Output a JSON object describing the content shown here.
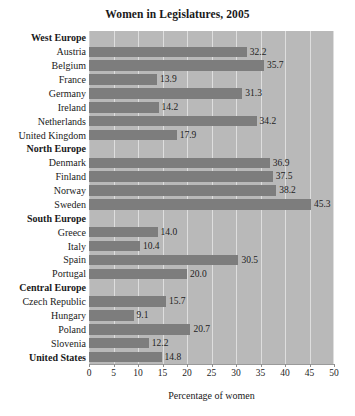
{
  "chart_data": {
    "type": "bar",
    "orientation": "horizontal",
    "title": "Women in Legislatures, 2005",
    "xlabel": "Percentage of women",
    "ylabel": "",
    "xlim": [
      0,
      50
    ],
    "xticks": [
      0,
      5,
      10,
      15,
      20,
      25,
      30,
      35,
      40,
      45,
      50
    ],
    "xtick_labels": [
      "0",
      "5",
      "10",
      "15",
      "20",
      "25",
      "30",
      "35",
      "40",
      "45",
      "50"
    ],
    "grid": true,
    "grid_axis": "x",
    "legend": false,
    "value_label_format": "one-decimal",
    "categories": [
      "West Europe",
      "Austria",
      "Belgium",
      "France",
      "Germany",
      "Ireland",
      "Netherlands",
      "United Kingdom",
      "North Europe",
      "Denmark",
      "Finland",
      "Norway",
      "Sweden",
      "South Europe",
      "Greece",
      "Italy",
      "Spain",
      "Portugal",
      "Central Europe",
      "Czech Republic",
      "Hungary",
      "Poland",
      "Slovenia",
      "United States"
    ],
    "rows": [
      {
        "label": "West Europe",
        "value": null,
        "value_label": "",
        "kind": "group"
      },
      {
        "label": "Austria",
        "value": 32.2,
        "value_label": "32.2",
        "kind": "bar"
      },
      {
        "label": "Belgium",
        "value": 35.7,
        "value_label": "35.7",
        "kind": "bar"
      },
      {
        "label": "France",
        "value": 13.9,
        "value_label": "13.9",
        "kind": "bar"
      },
      {
        "label": "Germany",
        "value": 31.3,
        "value_label": "31.3",
        "kind": "bar"
      },
      {
        "label": "Ireland",
        "value": 14.2,
        "value_label": "14.2",
        "kind": "bar"
      },
      {
        "label": "Netherlands",
        "value": 34.2,
        "value_label": "34.2",
        "kind": "bar"
      },
      {
        "label": "United Kingdom",
        "value": 17.9,
        "value_label": "17.9",
        "kind": "bar"
      },
      {
        "label": "North Europe",
        "value": null,
        "value_label": "",
        "kind": "group"
      },
      {
        "label": "Denmark",
        "value": 36.9,
        "value_label": "36.9",
        "kind": "bar"
      },
      {
        "label": "Finland",
        "value": 37.5,
        "value_label": "37.5",
        "kind": "bar"
      },
      {
        "label": "Norway",
        "value": 38.2,
        "value_label": "38.2",
        "kind": "bar"
      },
      {
        "label": "Sweden",
        "value": 45.3,
        "value_label": "45.3",
        "kind": "bar"
      },
      {
        "label": "South Europe",
        "value": null,
        "value_label": "",
        "kind": "group"
      },
      {
        "label": "Greece",
        "value": 14.0,
        "value_label": "14.0",
        "kind": "bar"
      },
      {
        "label": "Italy",
        "value": 10.4,
        "value_label": "10.4",
        "kind": "bar"
      },
      {
        "label": "Spain",
        "value": 30.5,
        "value_label": "30.5",
        "kind": "bar"
      },
      {
        "label": "Portugal",
        "value": 20.0,
        "value_label": "20.0",
        "kind": "bar"
      },
      {
        "label": "Central Europe",
        "value": null,
        "value_label": "",
        "kind": "group"
      },
      {
        "label": "Czech Republic",
        "value": 15.7,
        "value_label": "15.7",
        "kind": "bar"
      },
      {
        "label": "Hungary",
        "value": 9.1,
        "value_label": "9.1",
        "kind": "bar"
      },
      {
        "label": "Poland",
        "value": 20.7,
        "value_label": "20.7",
        "kind": "bar"
      },
      {
        "label": "Slovenia",
        "value": 12.2,
        "value_label": "12.2",
        "kind": "bar"
      },
      {
        "label": "United States",
        "value": 14.8,
        "value_label": "14.8",
        "kind": "group-bar"
      }
    ],
    "values": [
      null,
      32.2,
      35.7,
      13.9,
      31.3,
      14.2,
      34.2,
      17.9,
      null,
      36.9,
      37.5,
      38.2,
      45.3,
      null,
      14.0,
      10.4,
      30.5,
      20.0,
      null,
      15.7,
      9.1,
      20.7,
      12.2,
      14.8
    ],
    "colors": {
      "bar": "#7d7d7d",
      "plot_background": "#b9b9b9",
      "gridline": "#dedede",
      "text": "#1a1a1a",
      "axis": "#9a9a9a",
      "page_background": "#ffffff"
    }
  }
}
